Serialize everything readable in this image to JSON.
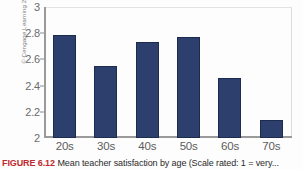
{
  "figure": {
    "credit": "© Cengage Learning 2013",
    "caption_label": "FIGURE 6.12",
    "caption_text": "Mean teacher satisfaction by age (Scale rated: 1 = very..."
  },
  "chart_data": {
    "type": "bar",
    "title": "",
    "xlabel": "",
    "ylabel": "",
    "categories": [
      "20s",
      "30s",
      "40s",
      "50s",
      "60s",
      "70s"
    ],
    "values": [
      2.79,
      2.55,
      2.73,
      2.77,
      2.46,
      2.14
    ],
    "ylim": [
      2,
      3
    ],
    "yticks": [
      "2",
      "2.2",
      "2.4",
      "2.6",
      "2.8",
      "3"
    ],
    "ytick_values": [
      2,
      2.2,
      2.4,
      2.6,
      2.8,
      3
    ],
    "grid": false,
    "legend": "none",
    "bar_color": "#2c3f6d",
    "axis_color": "#9a9a9a",
    "plot_background": "#fdfdfe"
  }
}
